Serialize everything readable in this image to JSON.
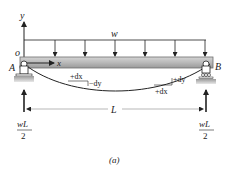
{
  "diagram": {
    "type": "simply-supported-beam-uniform-load",
    "caption": "(a)",
    "labels": {
      "y_axis": "y",
      "x_axis": "x",
      "origin": "o",
      "load": "w",
      "support_left": "A",
      "support_right": "B",
      "span": "L",
      "dx_left": "+dx",
      "dy_left": "−dy",
      "dx_right": "+dx",
      "dy_right": "+dy",
      "reaction_left_num": "wL",
      "reaction_left_den": "2",
      "reaction_right_num": "wL",
      "reaction_right_den": "2"
    },
    "load_arrow_count": 7,
    "colors": {
      "beam_fill": "#b9b9b9",
      "beam_edge": "#6e6e6e",
      "line": "#222222",
      "ground": "#a8a8a8"
    }
  }
}
